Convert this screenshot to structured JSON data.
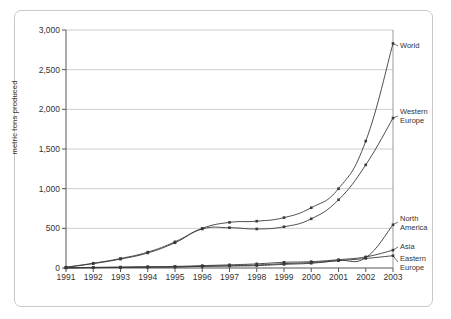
{
  "chart_data": {
    "type": "line",
    "title": "",
    "xlabel": "",
    "ylabel": "metric tons produced",
    "x": [
      1991,
      1992,
      1993,
      1994,
      1995,
      1996,
      1997,
      1998,
      1999,
      2000,
      2001,
      2002,
      2003
    ],
    "categories": [
      "1991",
      "1992",
      "1993",
      "1994",
      "1995",
      "1996",
      "1997",
      "1998",
      "1999",
      "2000",
      "2001",
      "2002",
      "2003"
    ],
    "ylim": [
      0,
      3000
    ],
    "yticks": [
      0,
      500,
      1000,
      1500,
      2000,
      2500,
      3000
    ],
    "ytick_labels": [
      "0",
      "500",
      "1,000",
      "1,500",
      "2,000",
      "2,500",
      "3,000"
    ],
    "grid": true,
    "legend_position": "right-inline-labels",
    "markers": true,
    "series": [
      {
        "name": "World",
        "label": "World",
        "values": [
          10,
          60,
          120,
          200,
          330,
          500,
          575,
          590,
          635,
          760,
          1000,
          1600,
          2830
        ]
      },
      {
        "name": "Western Europe",
        "label": "Western\nEurope",
        "values": [
          8,
          55,
          112,
          190,
          318,
          492,
          508,
          492,
          520,
          620,
          860,
          1300,
          1890
        ]
      },
      {
        "name": "North America",
        "label": "North\nAmerica",
        "values": [
          2,
          5,
          8,
          12,
          14,
          22,
          25,
          30,
          46,
          60,
          95,
          130,
          545
        ]
      },
      {
        "name": "Asia",
        "label": "Asia",
        "values": [
          3,
          8,
          12,
          16,
          20,
          30,
          40,
          52,
          72,
          80,
          105,
          140,
          225
        ]
      },
      {
        "name": "Eastern Europe",
        "label": "Eastern\nEurope",
        "values": [
          2,
          4,
          7,
          10,
          13,
          20,
          28,
          38,
          55,
          68,
          92,
          120,
          155
        ]
      }
    ]
  },
  "axis": {
    "y_title": "metric tons produced"
  },
  "series_labels": {
    "world": "World",
    "western_europe_line1": "Western",
    "western_europe_line2": "Europe",
    "north_america_line1": "North",
    "north_america_line2": "America",
    "asia": "Asia",
    "eastern_europe_line1": "Eastern",
    "eastern_europe_line2": "Europe"
  },
  "colors": {
    "line": "#3a3a3a",
    "grid": "#c0c0c0",
    "axis": "#555555",
    "frame": "#c9c9c9",
    "text": "#333333",
    "background": "#ffffff"
  }
}
